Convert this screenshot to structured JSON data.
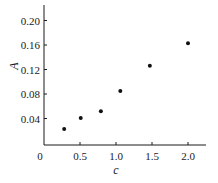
{
  "chart_data": {
    "type": "scatter",
    "title": "",
    "xlabel": "c",
    "ylabel": "A",
    "xlim": [
      0,
      2.25
    ],
    "ylim": [
      0,
      0.22
    ],
    "x_ticks": [
      0,
      0.5,
      1.0,
      1.5,
      2.0
    ],
    "x_tick_labels": [
      "0",
      "0.5",
      "1.0",
      "1.5",
      "2.0"
    ],
    "y_ticks": [
      0.04,
      0.08,
      0.12,
      0.16,
      0.2
    ],
    "y_tick_labels": [
      "0.04",
      "0.08",
      "0.12",
      "0.16",
      "0.20"
    ],
    "grid": false,
    "legend": null,
    "series": [
      {
        "name": "A vs c",
        "marker": "filled-circle",
        "color": "#111111",
        "x": [
          0.28,
          0.51,
          0.79,
          1.06,
          1.47,
          2.0
        ],
        "y": [
          0.023,
          0.041,
          0.052,
          0.085,
          0.126,
          0.163
        ]
      }
    ]
  }
}
